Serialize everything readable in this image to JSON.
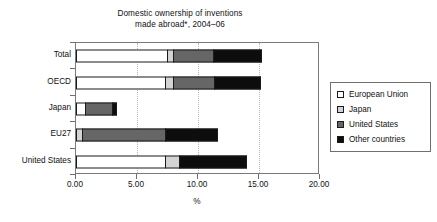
{
  "chart_data": {
    "type": "bar",
    "orientation": "horizontal",
    "stacked": true,
    "title": "Domestic ownership of inventions\nmade abroad*, 2004–06",
    "title_line1": "Domestic ownership of inventions",
    "title_line2": "made abroad*, 2004–06",
    "xlabel": "%",
    "ylabel": "",
    "xlim": [
      0,
      20
    ],
    "xticks": [
      0,
      5,
      10,
      15,
      20
    ],
    "xtick_labels": [
      "0.00",
      "5.00",
      "10.00",
      "15.00",
      "20.00"
    ],
    "grid": "vertical-dotted",
    "legend_position": "right",
    "categories": [
      "Total",
      "OECD",
      "Japan",
      "EU27",
      "United States"
    ],
    "series": [
      {
        "name": "European Union",
        "color": "#ffffff",
        "values": [
          7.5,
          7.4,
          0.8,
          0.0,
          7.4
        ]
      },
      {
        "name": "Japan",
        "color": "#d3d3d3",
        "values": [
          0.6,
          0.7,
          0.0,
          0.6,
          1.2
        ]
      },
      {
        "name": "United States",
        "color": "#666666",
        "values": [
          3.4,
          3.5,
          2.3,
          6.9,
          0.0
        ]
      },
      {
        "name": "Other countries",
        "color": "#0d0d0d",
        "values": [
          4.0,
          3.8,
          0.4,
          4.3,
          5.6
        ]
      }
    ],
    "totals": [
      15.5,
      15.4,
      3.5,
      11.8,
      14.2
    ]
  },
  "legend": {
    "items": [
      {
        "label": "European Union",
        "color": "#ffffff"
      },
      {
        "label": "Japan",
        "color": "#d3d3d3"
      },
      {
        "label": "United States",
        "color": "#666666"
      },
      {
        "label": "Other countries",
        "color": "#0d0d0d"
      }
    ]
  }
}
